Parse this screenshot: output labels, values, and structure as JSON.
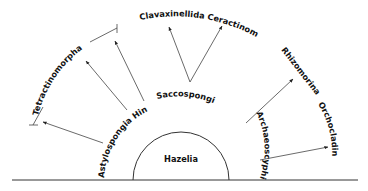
{
  "diagram": {
    "type": "phylogenetic-radiation",
    "root": "Hazelia",
    "groups": {
      "bracket_label": "Tetractinomorpha",
      "lower_left_label": "Astylospongia Hindia ?",
      "center_label": "Saccospongia",
      "top_left_label": "Clavaxinellida",
      "top_right_label": "Ceractinomorpha",
      "right_label": "Archaeoscyphia",
      "upper_right_label": "Rhizomorina",
      "far_right_label": "Orchocladina"
    },
    "edges": [
      {
        "from": "Astylospongia Hindia ?",
        "to": "Tetractinomorpha"
      },
      {
        "from": "Saccospongia",
        "to": "Clavaxinellida"
      },
      {
        "from": "Saccospongia",
        "to": "Ceractinomorpha"
      },
      {
        "from": "Archaeoscyphia",
        "to": "Rhizomorina"
      },
      {
        "from": "Archaeoscyphia",
        "to": "Orchocladina"
      }
    ]
  }
}
